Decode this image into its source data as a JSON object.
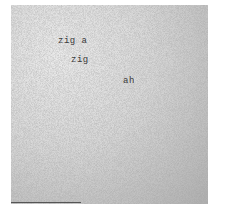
{
  "document": {
    "words": [
      {
        "text": "zig a"
      },
      {
        "text": "zig"
      },
      {
        "text": "ah"
      }
    ],
    "background_color": "#d4d4d4",
    "text_color": "#3a3a3a"
  }
}
